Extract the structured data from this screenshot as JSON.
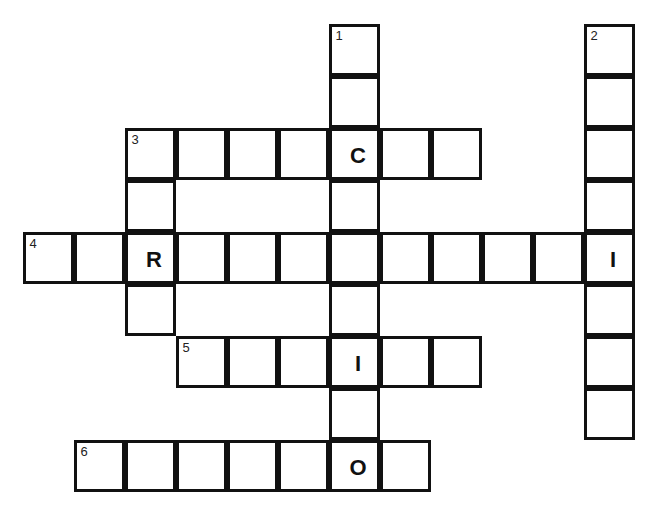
{
  "page": {
    "top_text_cropped": "",
    "grid": {
      "origin_x": 24,
      "origin_y": 25,
      "cell_w": 51,
      "cell_h": 52
    }
  },
  "puzzle": {
    "entries": [
      {
        "number": 1,
        "direction": "down",
        "row": 0,
        "col": 6,
        "length": 9
      },
      {
        "number": 2,
        "direction": "down",
        "row": 0,
        "col": 11,
        "length": 8
      },
      {
        "number": 3,
        "direction": "across",
        "row": 2,
        "col": 2,
        "length": 7
      },
      {
        "number": 3,
        "direction": "down",
        "row": 2,
        "col": 2,
        "length": 4
      },
      {
        "number": 4,
        "direction": "across",
        "row": 4,
        "col": 0,
        "length": 12
      },
      {
        "number": 5,
        "direction": "across",
        "row": 6,
        "col": 3,
        "length": 6
      },
      {
        "number": 6,
        "direction": "across",
        "row": 8,
        "col": 1,
        "length": 7
      }
    ],
    "given_letters": [
      {
        "row": 2,
        "col": 6,
        "letter": "C"
      },
      {
        "row": 4,
        "col": 2,
        "letter": "R"
      },
      {
        "row": 4,
        "col": 11,
        "letter": "I"
      },
      {
        "row": 6,
        "col": 6,
        "letter": "I"
      },
      {
        "row": 8,
        "col": 6,
        "letter": "O"
      }
    ]
  }
}
